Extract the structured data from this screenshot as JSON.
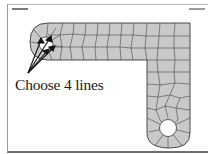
{
  "slide": {
    "header_left": "",
    "header_right": "",
    "caption": "Choose 4 lines"
  },
  "figure": {
    "mesh_fill": "#c9c9c9",
    "mesh_line": "#3a3a3a",
    "arrow_count": 4,
    "selected_feature": "left-hole-edges"
  }
}
